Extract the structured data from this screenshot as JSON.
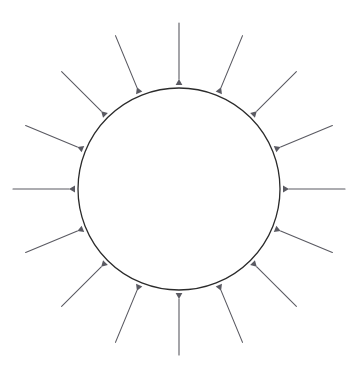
{
  "canvas": {
    "width": 354,
    "height": 367,
    "background_color": "#ffffff"
  },
  "diagram": {
    "type": "radial-inward-arrow-diagram",
    "title": "",
    "circle": {
      "name": "central-circle",
      "center_x": 179,
      "center_y": 189,
      "radius": 101,
      "stroke_color": "#2b2b2b",
      "stroke_width": 1.3,
      "fill": "none"
    },
    "arrows": {
      "count": 16,
      "angle_step_degrees": 22.5,
      "start_angle_degrees": -90,
      "tail_radius": 166,
      "tip_radius": 110,
      "stroke_color": "#5a5a62",
      "stroke_width": 1.1,
      "head_length": 6,
      "head_width": 3.4,
      "direction": "inward",
      "items": [
        {
          "index": 0,
          "angle_degrees": -90.0,
          "label": "arrow-top"
        },
        {
          "index": 1,
          "angle_degrees": -67.5,
          "label": "arrow-top-right-1"
        },
        {
          "index": 2,
          "angle_degrees": -45.0,
          "label": "arrow-top-right-2"
        },
        {
          "index": 3,
          "angle_degrees": -22.5,
          "label": "arrow-top-right-3"
        },
        {
          "index": 4,
          "angle_degrees": 0.0,
          "label": "arrow-right"
        },
        {
          "index": 5,
          "angle_degrees": 22.5,
          "label": "arrow-bottom-right-1"
        },
        {
          "index": 6,
          "angle_degrees": 45.0,
          "label": "arrow-bottom-right-2"
        },
        {
          "index": 7,
          "angle_degrees": 67.5,
          "label": "arrow-bottom-right-3"
        },
        {
          "index": 8,
          "angle_degrees": 90.0,
          "label": "arrow-bottom"
        },
        {
          "index": 9,
          "angle_degrees": 112.5,
          "label": "arrow-bottom-left-3"
        },
        {
          "index": 10,
          "angle_degrees": 135.0,
          "label": "arrow-bottom-left-2"
        },
        {
          "index": 11,
          "angle_degrees": 157.5,
          "label": "arrow-bottom-left-1"
        },
        {
          "index": 12,
          "angle_degrees": 180.0,
          "label": "arrow-left"
        },
        {
          "index": 13,
          "angle_degrees": 202.5,
          "label": "arrow-top-left-1"
        },
        {
          "index": 14,
          "angle_degrees": 225.0,
          "label": "arrow-top-left-2"
        },
        {
          "index": 15,
          "angle_degrees": 247.5,
          "label": "arrow-top-left-3"
        }
      ]
    }
  }
}
